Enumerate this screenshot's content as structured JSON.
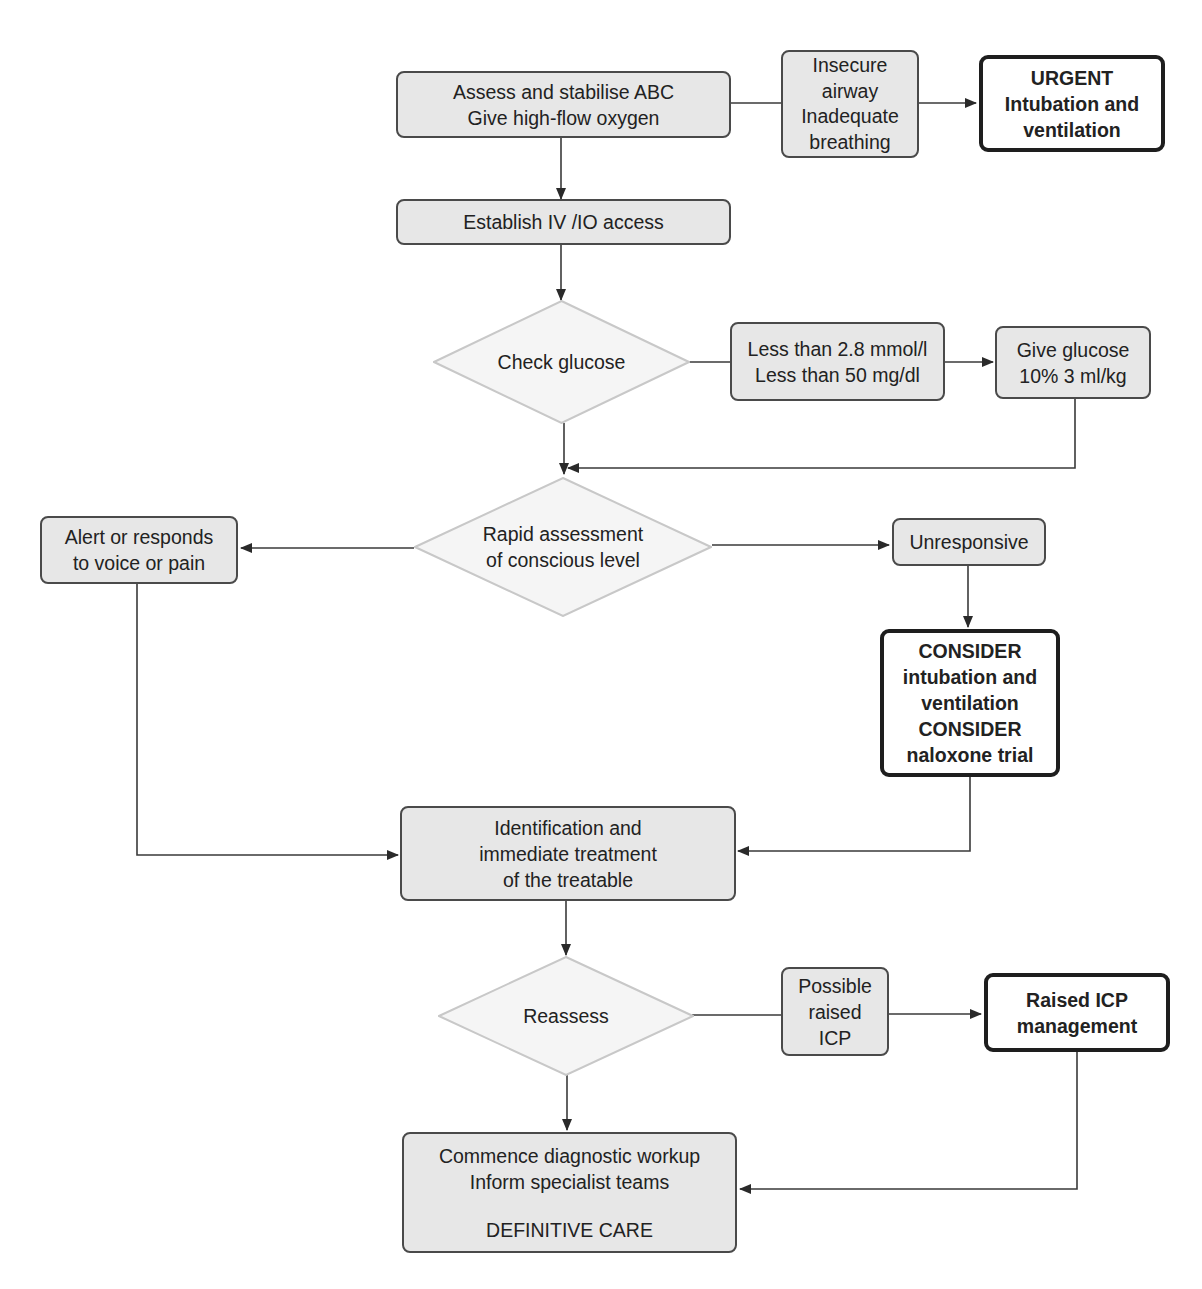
{
  "diagram": {
    "type": "flowchart",
    "colors": {
      "process_fill": "#e7e7e7",
      "process_border": "#4a4a4a",
      "decision_fill": "#f5f5f5",
      "decision_border": "#c8c8c8",
      "action_fill": "#ffffff",
      "action_border": "#1e1e1e",
      "arrow": "#2a2a2a"
    },
    "nodes": {
      "assess_abc": {
        "lines": [
          "Assess and stabilise ABC",
          "Give high-flow oxygen"
        ]
      },
      "insecure_airway": {
        "lines": [
          "Insecure",
          "airway",
          "Inadequate",
          "breathing"
        ]
      },
      "urgent_intubation": {
        "lines": [
          "URGENT",
          "Intubation and",
          "ventilation"
        ]
      },
      "iv_access": {
        "lines": [
          "Establish IV /IO access"
        ]
      },
      "check_glucose": {
        "lines": [
          "Check glucose"
        ]
      },
      "low_glucose": {
        "lines": [
          "Less than 2.8 mmol/l",
          "Less than 50 mg/dl"
        ]
      },
      "give_glucose": {
        "lines": [
          "Give glucose",
          "10% 3 ml/kg"
        ]
      },
      "rapid_assessment": {
        "lines": [
          "Rapid assessment",
          "of conscious level"
        ]
      },
      "alert_responds": {
        "lines": [
          "Alert or responds",
          "to voice or pain"
        ]
      },
      "unresponsive": {
        "lines": [
          "Unresponsive"
        ]
      },
      "consider_intubation": {
        "lines": [
          "CONSIDER",
          "intubation and",
          "ventilation",
          "CONSIDER",
          "naloxone trial"
        ]
      },
      "identification": {
        "lines": [
          "Identification and",
          "immediate treatment",
          "of the treatable"
        ]
      },
      "reassess": {
        "lines": [
          "Reassess"
        ]
      },
      "possible_icp": {
        "lines": [
          "Possible",
          "raised",
          "ICP"
        ]
      },
      "icp_management": {
        "lines": [
          "Raised ICP",
          "management"
        ]
      },
      "definitive_care": {
        "lines": [
          "Commence diagnostic workup",
          "Inform specialist teams"
        ],
        "footer": "DEFINITIVE CARE"
      }
    },
    "edges": [
      {
        "from": "assess_abc",
        "to": "urgent_intubation",
        "via": "insecure_airway"
      },
      {
        "from": "assess_abc",
        "to": "iv_access"
      },
      {
        "from": "iv_access",
        "to": "check_glucose"
      },
      {
        "from": "check_glucose",
        "to": "give_glucose",
        "via": "low_glucose"
      },
      {
        "from": "check_glucose",
        "to": "rapid_assessment"
      },
      {
        "from": "give_glucose",
        "to": "rapid_assessment"
      },
      {
        "from": "rapid_assessment",
        "to": "alert_responds"
      },
      {
        "from": "rapid_assessment",
        "to": "unresponsive"
      },
      {
        "from": "unresponsive",
        "to": "consider_intubation"
      },
      {
        "from": "alert_responds",
        "to": "identification"
      },
      {
        "from": "consider_intubation",
        "to": "identification"
      },
      {
        "from": "identification",
        "to": "reassess"
      },
      {
        "from": "reassess",
        "to": "icp_management",
        "via": "possible_icp"
      },
      {
        "from": "reassess",
        "to": "definitive_care"
      },
      {
        "from": "icp_management",
        "to": "definitive_care"
      }
    ]
  }
}
